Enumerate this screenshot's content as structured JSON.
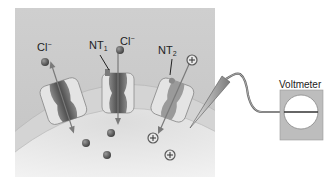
{
  "figure": {
    "labels": {
      "chloride_left": {
        "base": "Cl",
        "sup": "−"
      },
      "nt1": {
        "base": "NT",
        "sub": "1"
      },
      "chloride_center": {
        "base": "Cl",
        "sup": "−"
      },
      "nt2": {
        "base": "NT",
        "sub": "2"
      },
      "voltmeter": "Voltmeter"
    },
    "ions": {
      "positive_symbol": "+"
    },
    "colors": {
      "extracellular_bg": "#c9c9c9",
      "cell_interior": "#e6e6e6",
      "membrane": "#d2d2d2",
      "channel_body": "#e2e2e2",
      "channel_pore": "#6a6a6a",
      "ion_dark": "#5a5a5a",
      "meter_box": "#bdbdbd"
    }
  }
}
